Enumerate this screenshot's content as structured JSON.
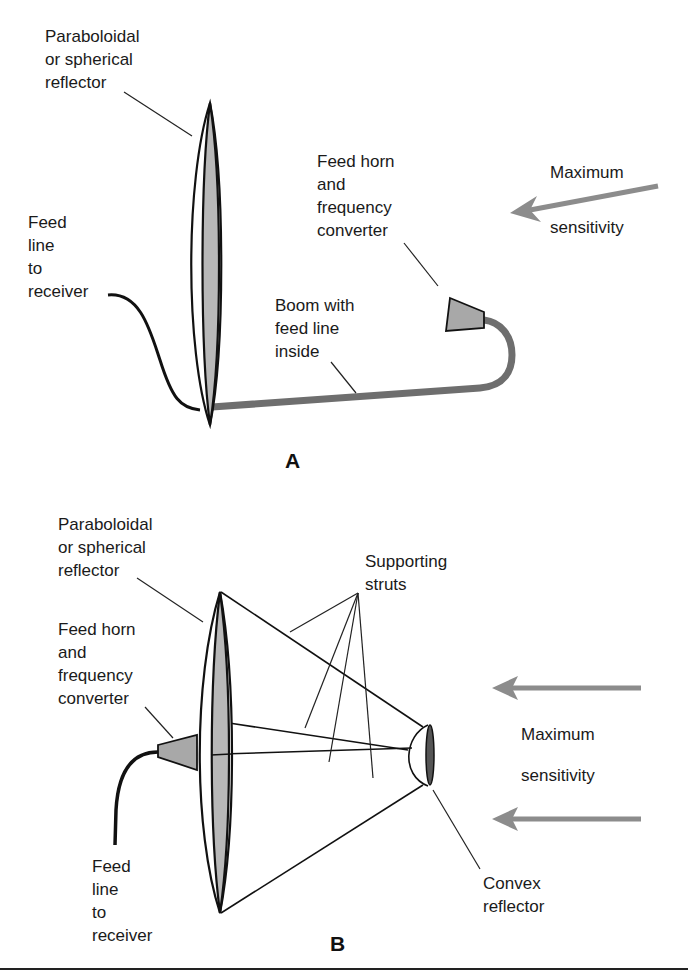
{
  "figure": {
    "panel_a": {
      "letter": "A",
      "labels": {
        "reflector": [
          "Paraboloidal",
          "or spherical",
          "reflector"
        ],
        "feed_line": [
          "Feed",
          "line",
          "to",
          "receiver"
        ],
        "feed_horn": [
          "Feed horn",
          "and",
          "frequency",
          "converter"
        ],
        "boom": [
          "Boom with",
          "feed line",
          "inside"
        ],
        "sensitivity": [
          "Maximum",
          "sensitivity"
        ]
      }
    },
    "panel_b": {
      "letter": "B",
      "labels": {
        "reflector": [
          "Paraboloidal",
          "or spherical",
          "reflector"
        ],
        "feed_horn": [
          "Feed horn",
          "and",
          "frequency",
          "converter"
        ],
        "feed_line": [
          "Feed",
          "line",
          "to",
          "receiver"
        ],
        "struts": [
          "Supporting",
          "struts"
        ],
        "sensitivity": [
          "Maximum",
          "sensitivity"
        ],
        "convex": [
          "Convex",
          "reflector"
        ]
      }
    },
    "colors": {
      "reflector_fill": "#b8b8b8",
      "boom": "#6e6e6e",
      "arrow": "#8c8c8c",
      "line": "#111111"
    }
  }
}
